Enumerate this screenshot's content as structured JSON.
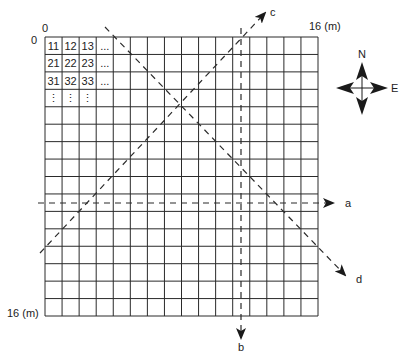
{
  "grid": {
    "rows": 16,
    "cols": 16,
    "origin_x_label": "0",
    "origin_y_label": "0",
    "x_end_label": "16 (m)",
    "y_end_label": "16 (m)",
    "cell_labels": [
      [
        "11",
        "12",
        "13",
        "..."
      ],
      [
        "21",
        "22",
        "23",
        "..."
      ],
      [
        "31",
        "32",
        "33",
        "..."
      ],
      [
        "⋮",
        "⋮",
        "⋮",
        ""
      ]
    ]
  },
  "transects": [
    {
      "label": "a",
      "direction": "west-east",
      "style": "dashed"
    },
    {
      "label": "b",
      "direction": "north-south",
      "style": "dashed"
    },
    {
      "label": "c",
      "direction": "southwest-northeast",
      "style": "dashed"
    },
    {
      "label": "d",
      "direction": "northwest-southeast",
      "style": "dashed"
    }
  ],
  "compass": {
    "north_label": "N",
    "east_label": "E"
  },
  "colors": {
    "line": "#2a2a2a",
    "background": "#ffffff"
  }
}
